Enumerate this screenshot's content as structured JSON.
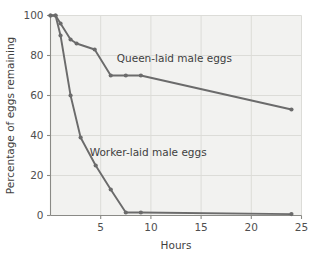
{
  "chart_data": {
    "type": "line",
    "title": "",
    "xlabel": "Hours",
    "ylabel": "Percentage of eggs remaining",
    "xlim": [
      0,
      25
    ],
    "ylim": [
      0,
      100
    ],
    "xticks": [
      5,
      10,
      15,
      20,
      25
    ],
    "yticks": [
      0,
      20,
      40,
      60,
      80,
      100
    ],
    "xtick_labels": [
      "5",
      "10",
      "15",
      "20",
      "25"
    ],
    "ytick_labels": [
      "0",
      "20",
      "40",
      "60",
      "80",
      "100"
    ],
    "grid": true,
    "legend_position": "inline-annotation",
    "line_color": "#6b6b6b",
    "marker_color": "#6b6b6b",
    "plot_background": "#f2f2f0",
    "gridline_color": "#dcdcd8",
    "axis_color": "#8a8a86",
    "series": [
      {
        "name": "Queen-laid male eggs",
        "label_x": 6.6,
        "label_y": 77,
        "points": [
          {
            "x": 0.0,
            "y": 100
          },
          {
            "x": 0.5,
            "y": 100
          },
          {
            "x": 1.0,
            "y": 96
          },
          {
            "x": 2.0,
            "y": 88
          },
          {
            "x": 2.6,
            "y": 86
          },
          {
            "x": 4.4,
            "y": 83
          },
          {
            "x": 6.0,
            "y": 70
          },
          {
            "x": 7.5,
            "y": 70
          },
          {
            "x": 9.0,
            "y": 70
          },
          {
            "x": 24.0,
            "y": 53
          }
        ]
      },
      {
        "name": "Worker-laid male eggs",
        "label_x": 3.9,
        "label_y": 30,
        "points": [
          {
            "x": 0.0,
            "y": 100
          },
          {
            "x": 0.5,
            "y": 100
          },
          {
            "x": 1.0,
            "y": 90
          },
          {
            "x": 2.0,
            "y": 60
          },
          {
            "x": 3.0,
            "y": 39
          },
          {
            "x": 4.5,
            "y": 25
          },
          {
            "x": 6.0,
            "y": 13
          },
          {
            "x": 7.5,
            "y": 1.5
          },
          {
            "x": 9.0,
            "y": 1.5
          },
          {
            "x": 24.0,
            "y": 0.7
          }
        ]
      }
    ]
  }
}
